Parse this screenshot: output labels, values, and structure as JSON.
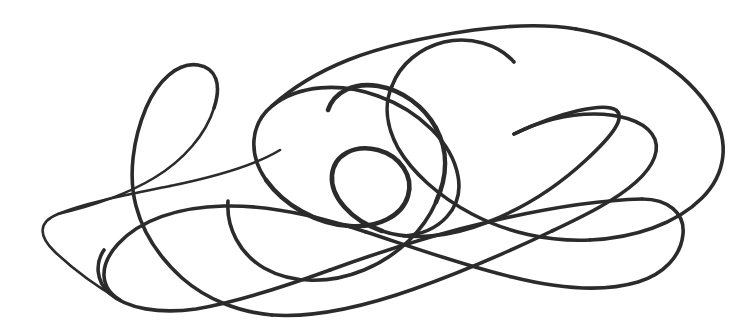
{
  "canvas": {
    "width": 756,
    "height": 335,
    "background_color": "#ffffff",
    "title": "hand-drawn continuous line scribble"
  },
  "drawing": {
    "name": "continuous-line-doodle",
    "description": "A single continuous hand-drawn looping line with a spiral at center, teardrop loops at left, a large arc at right, and two free endpoints",
    "stroke_color": "#2b2b2b",
    "stroke_width": 3.6,
    "stroke_width_thin": 2.6,
    "stroke_width_thick": 4.6,
    "endpoints": [
      {
        "name": "free-end-lower-left",
        "x": 104,
        "y": 250
      },
      {
        "name": "free-end-mid-left",
        "x": 228,
        "y": 201
      }
    ],
    "features": [
      {
        "name": "left-teardrop-loop-apex",
        "x": 205,
        "y": 66
      },
      {
        "name": "left-thin-loop-tip",
        "x": 43,
        "y": 241
      },
      {
        "name": "top-arc-apex",
        "x": 540,
        "y": 25
      },
      {
        "name": "right-arc-extreme",
        "x": 722,
        "y": 143
      },
      {
        "name": "spiral-center-knot",
        "x": 383,
        "y": 170
      },
      {
        "name": "bottom-u-low-point",
        "x": 190,
        "y": 309
      },
      {
        "name": "bottom-right-hook",
        "x": 642,
        "y": 281
      },
      {
        "name": "right-s-curve-notch",
        "x": 604,
        "y": 110
      }
    ],
    "segments": [
      {
        "name": "segment-left-tail-and-teardrop",
        "d": "M 104 250 C 96 262 97 278 108 290 C 124 307 156 313 190 309 C 236 303 288 285 336 266 C 392 244 448 223 505 205 C 556 189 608 176 660 172"
      },
      {
        "name": "segment-thin-loop",
        "d": "M 43 241 C 36 230 44 219 62 212 C 92 200 140 191 186 182 C 232 173 268 160 286 140"
      },
      {
        "name": "segment-spiral",
        "d": "M 383 170 C 368 160 346 162 337 178 C 326 197 338 221 361 228 C 392 238 425 218 434 188"
      }
    ]
  },
  "colors": {
    "ink": "#2b2b2b",
    "paper": "#ffffff"
  }
}
